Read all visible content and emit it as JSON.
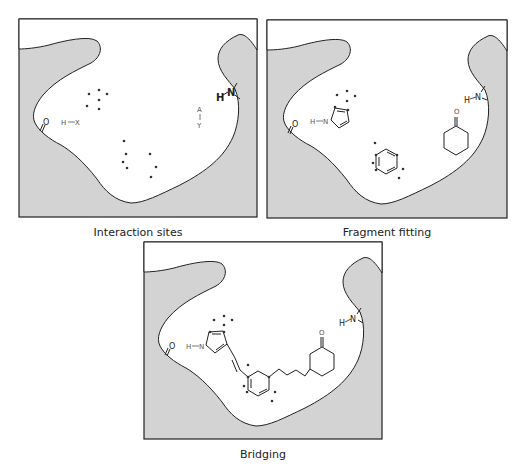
{
  "figure": {
    "panels": [
      {
        "id": "interaction-sites",
        "caption": "Interaction sites",
        "labels": {
          "h_x_h": "H",
          "h_x_x": "X",
          "acceptor_a": "A",
          "acceptor_y": "Y",
          "carbonyl_o": "O",
          "amine_h": "H",
          "amine_n": "N"
        }
      },
      {
        "id": "fragment-fitting",
        "caption": "Fragment fitting",
        "labels": {
          "pyrrole_h": "H",
          "pyrrole_n": "N",
          "ketone_o": "O",
          "carbonyl_o": "O",
          "amine_h": "H",
          "amine_n": "N"
        }
      },
      {
        "id": "bridging",
        "caption": "Bridging",
        "labels": {
          "pyrrole_h": "H",
          "pyrrole_n": "N",
          "ketone_o": "O",
          "carbonyl_o": "O",
          "amine_h": "H",
          "amine_n": "N"
        }
      }
    ],
    "colors": {
      "pocket_fill": "#d3d3d3",
      "outline": "#222222",
      "label": "#555555"
    }
  }
}
